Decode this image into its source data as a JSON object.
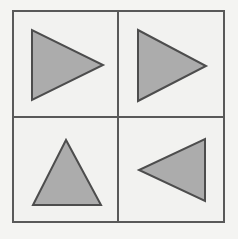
{
  "figure": {
    "canvas": {
      "width": 238,
      "height": 239
    },
    "background_color": "#f4f4f2"
  },
  "frame": {
    "name": "outer-frame",
    "x": 13,
    "y": 11,
    "width": 211,
    "height": 211,
    "stroke_color": "#595959",
    "stroke_width": 2,
    "fill_color": "#f2f2f0"
  },
  "dividers": {
    "stroke_color": "#595959",
    "stroke_width": 2,
    "vertical": {
      "name": "vertical-divider",
      "x": 118,
      "y1": 11,
      "y2": 222
    },
    "horizontal": {
      "name": "horizontal-divider",
      "y": 117,
      "x1": 13,
      "x2": 224
    }
  },
  "style": {
    "triangle_fill": "#acacac",
    "triangle_stroke": "#4d4d4d",
    "triangle_stroke_width": 2
  },
  "cells": [
    {
      "name": "cell-top-left",
      "row": 1,
      "column": 1,
      "shape": "triangle",
      "orientation": "right",
      "direction_label": "points right",
      "points": "32,30 32,100 103,65",
      "fill": "#acacac",
      "stroke": "#4d4d4d"
    },
    {
      "name": "cell-top-right",
      "row": 1,
      "column": 2,
      "shape": "triangle",
      "orientation": "right",
      "direction_label": "points right",
      "points": "138,30 138,101 206,66",
      "fill": "#acacac",
      "stroke": "#4d4d4d"
    },
    {
      "name": "cell-bottom-left",
      "row": 2,
      "column": 1,
      "shape": "triangle",
      "orientation": "up",
      "direction_label": "points up",
      "points": "66,140 33,205 101,205",
      "fill": "#acacac",
      "stroke": "#4d4d4d"
    },
    {
      "name": "cell-bottom-right",
      "row": 2,
      "column": 2,
      "shape": "triangle",
      "orientation": "left",
      "direction_label": "points left",
      "points": "205,139 205,201 139,170",
      "fill": "#acacac",
      "stroke": "#4d4d4d"
    }
  ]
}
